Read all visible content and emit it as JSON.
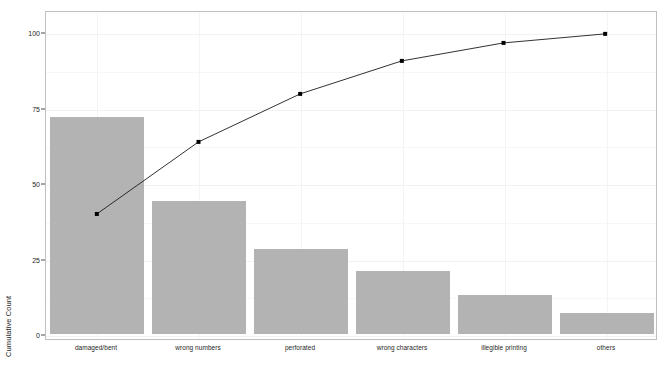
{
  "chart_data": {
    "type": "bar",
    "title": "",
    "subtitle": "",
    "xlabel": "",
    "ylabel": "Cumulative Count",
    "categories": [
      "damaged/bent",
      "wrong numbers",
      "perforated",
      "wrong characters",
      "illegible printing",
      "others"
    ],
    "series": [
      {
        "name": "Count",
        "type": "bar",
        "values": [
          72,
          44,
          28,
          21,
          13,
          7
        ]
      },
      {
        "name": "Cumulative Percentage",
        "type": "line",
        "values": [
          40,
          64,
          80,
          91,
          97,
          100
        ]
      }
    ],
    "ylim": [
      0,
      100
    ],
    "y_ticks": [
      0,
      25,
      50,
      75,
      100
    ],
    "y_tick_labels": [
      "0",
      "25",
      "50",
      "75",
      "100"
    ],
    "grid": true,
    "legend": "none",
    "bar_color": "#b3b3b3",
    "line_color": "#1a1a1a",
    "point_color": "#000000",
    "panel_border_color": "#bfbfbf",
    "gridline_color": "#f2f2f2",
    "background_color": "#ffffff"
  }
}
